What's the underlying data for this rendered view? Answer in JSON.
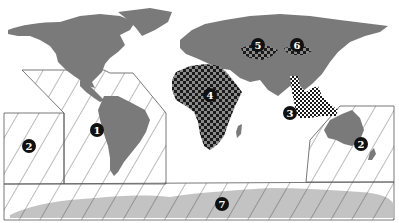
{
  "map": {
    "type": "world-map",
    "colors": {
      "land": "#7a7a7a",
      "antarctica": "#bdbdbd",
      "hatch_line": "#555555",
      "region_border": "#555555",
      "checker_dark": "#1a1a1a",
      "checker_light": "#8a8a8a",
      "marker_fill": "#111111",
      "marker_text": "#ffffff",
      "background": "#ffffff"
    },
    "markers": [
      {
        "id": "1",
        "label": "1",
        "region": "Eastern Pacific / South America zone",
        "pattern": "hatched",
        "x": 97,
        "y": 130
      },
      {
        "id": "2a",
        "label": "2",
        "region": "Central Pacific zone",
        "pattern": "hatched",
        "x": 29,
        "y": 146
      },
      {
        "id": "2b",
        "label": "2",
        "region": "Western Pacific / Australia zone",
        "pattern": "hatched",
        "x": 361,
        "y": 144
      },
      {
        "id": "3",
        "label": "3",
        "region": "Southeast Asia",
        "pattern": "checkered",
        "x": 290,
        "y": 113
      },
      {
        "id": "4",
        "label": "4",
        "region": "Africa",
        "pattern": "checkered",
        "x": 210,
        "y": 95
      },
      {
        "id": "5",
        "label": "5",
        "region": "Central Asia (west)",
        "pattern": "checkered",
        "x": 258,
        "y": 45
      },
      {
        "id": "6",
        "label": "6",
        "region": "Central Asia (east)",
        "pattern": "checkered",
        "x": 297,
        "y": 45
      },
      {
        "id": "7",
        "label": "7",
        "region": "Southern Ocean / Antarctica",
        "pattern": "hatched",
        "x": 222,
        "y": 204
      }
    ]
  }
}
